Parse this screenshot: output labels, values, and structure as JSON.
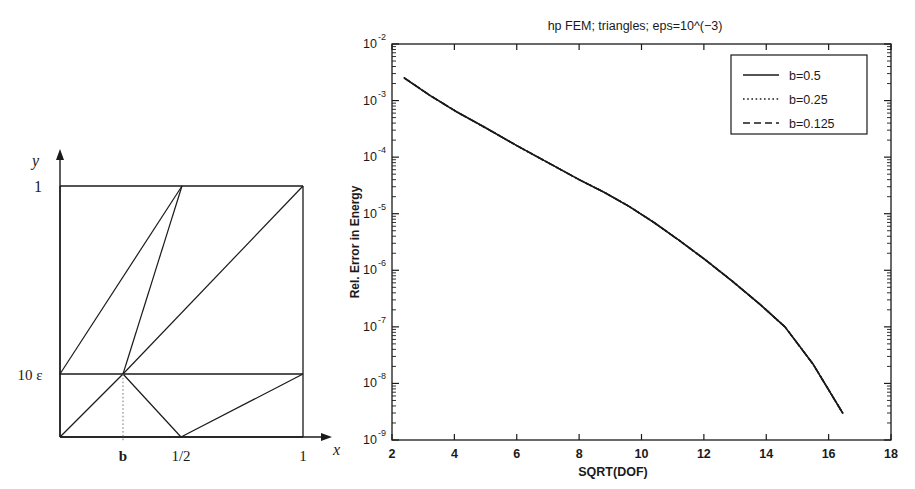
{
  "figure": {
    "panels": [
      "mesh-diagram",
      "convergence-chart"
    ]
  },
  "mesh": {
    "axis_label_y": "y",
    "axis_label_x": "x",
    "y_tick_top": "1",
    "y_tick_mid": "10 ε",
    "x_tick_b": "b",
    "x_tick_half": "1/2",
    "x_tick_one": "1",
    "line_color": "#1a1a1a",
    "dotted_color": "#777777"
  },
  "chart_data": {
    "type": "line",
    "title": "hp FEM; triangles; eps=10^(−3)",
    "xlabel": "SQRT(DOF)",
    "ylabel": "Rel. Error in Energy",
    "xscale": "linear",
    "yscale": "log",
    "xlim": [
      2,
      18
    ],
    "ylim": [
      1e-09,
      0.01
    ],
    "grid": false,
    "xticks": [
      2,
      4,
      6,
      8,
      10,
      12,
      14,
      16,
      18
    ],
    "xticklabels": [
      "2",
      "4",
      "6",
      "8",
      "10",
      "12",
      "14",
      "16",
      "18"
    ],
    "yticks": [
      0.01,
      0.001,
      0.0001,
      1e-05,
      1e-06,
      1e-07,
      1e-08,
      1e-09
    ],
    "yticklabels": [
      "10",
      "10",
      "10",
      "10",
      "10",
      "10",
      "10",
      "10"
    ],
    "ytickexponents": [
      "-2",
      "-3",
      "-4",
      "-5",
      "-6",
      "-7",
      "-8",
      "-9"
    ],
    "legend_position": "upper right",
    "series": [
      {
        "name": "b=0.5",
        "style": "solid",
        "x": [
          2.4,
          3.2,
          4.1,
          5.0,
          6.0,
          7.0,
          8.0,
          8.8,
          9.6,
          10.4,
          11.2,
          12.0,
          12.9,
          13.8,
          14.6,
          15.5,
          16.45
        ],
        "y": [
          0.0025,
          0.00125,
          0.00062,
          0.00033,
          0.00016,
          8e-05,
          4e-05,
          2.4e-05,
          1.35e-05,
          7e-06,
          3.4e-06,
          1.6e-06,
          6.5e-07,
          2.5e-07,
          1e-07,
          2.2e-08,
          3e-09
        ]
      },
      {
        "name": "b=0.25",
        "style": "dotted",
        "x": [
          2.4,
          3.2,
          4.1,
          5.0,
          6.0,
          7.0,
          8.0,
          8.8,
          9.6,
          10.4,
          11.2,
          12.0,
          12.9,
          13.8,
          14.6,
          15.5,
          16.45
        ],
        "y": [
          0.0025,
          0.00125,
          0.00062,
          0.00033,
          0.00016,
          8e-05,
          4e-05,
          2.4e-05,
          1.35e-05,
          7e-06,
          3.4e-06,
          1.6e-06,
          6.5e-07,
          2.5e-07,
          1e-07,
          2.2e-08,
          3e-09
        ]
      },
      {
        "name": "b=0.125",
        "style": "dashed",
        "x": [
          2.4,
          3.2,
          4.1,
          5.0,
          6.0,
          7.0,
          8.0,
          8.8,
          9.6,
          10.4,
          11.2,
          12.0,
          12.9,
          13.8,
          14.6,
          15.5,
          16.45
        ],
        "y": [
          0.0025,
          0.00125,
          0.00062,
          0.00033,
          0.00016,
          8e-05,
          4e-05,
          2.4e-05,
          1.35e-05,
          7e-06,
          3.4e-06,
          1.6e-06,
          6.5e-07,
          2.5e-07,
          1e-07,
          2.2e-08,
          3e-09
        ]
      }
    ],
    "legend": [
      {
        "label": "b=0.5",
        "style": "solid"
      },
      {
        "label": "b=0.25",
        "style": "dotted"
      },
      {
        "label": "b=0.125",
        "style": "dashed"
      }
    ],
    "line_color": "#1a1a1a"
  }
}
